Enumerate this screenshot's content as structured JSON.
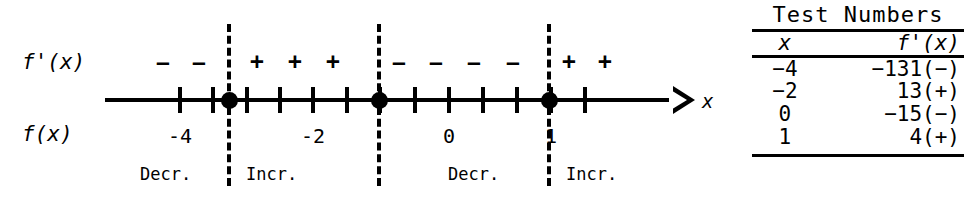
{
  "sign_chart": {
    "row_labels": {
      "derivative": "f'(x)",
      "function": "f(x)"
    },
    "axis_name": "x",
    "critical_points": [
      -3,
      -1,
      1
    ],
    "tick_values": [
      -4,
      -3.5,
      -3,
      -2.5,
      -2,
      -1.5,
      -1,
      -0.5,
      0,
      0.5,
      1,
      1.5
    ],
    "labeled_values": [
      "-4",
      "-2",
      "0",
      "1"
    ],
    "sign_regions": [
      {
        "signs": [
          "−",
          "−"
        ],
        "behavior": "Decr."
      },
      {
        "signs": [
          "+",
          "+",
          "+"
        ],
        "behavior": "Incr."
      },
      {
        "signs": [
          "−",
          "−",
          "−",
          "−"
        ],
        "behavior": "Decr."
      },
      {
        "signs": [
          "+",
          "+"
        ],
        "behavior": "Incr."
      }
    ]
  },
  "test_table": {
    "title": "Test Numbers",
    "headers": [
      "x",
      "f'(x)"
    ],
    "rows": [
      {
        "x": "−4",
        "fprime": "−131(−)"
      },
      {
        "x": "−2",
        "fprime": "13(+)"
      },
      {
        "x": "0",
        "fprime": "−15(−)"
      },
      {
        "x": "1",
        "fprime": "4(+)"
      }
    ]
  },
  "colors": {
    "ink": "#000000",
    "paper": "#ffffff"
  }
}
